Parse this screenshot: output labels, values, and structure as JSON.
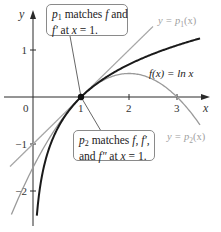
{
  "figure": {
    "type": "function-approximation-diagram",
    "axes": {
      "x_label": "x",
      "y_label": "y",
      "origin_label": "0",
      "x_ticks": [
        {
          "value": 1,
          "label": "1"
        },
        {
          "value": 2,
          "label": "2"
        },
        {
          "value": 3,
          "label": "3"
        }
      ],
      "y_ticks": [
        {
          "value": 1,
          "label": "1"
        },
        {
          "value": -1,
          "label": "−1"
        },
        {
          "value": -2,
          "label": "−2"
        }
      ],
      "x_range": [
        -0.7,
        3.6
      ],
      "y_range": [
        -2.7,
        1.8
      ]
    },
    "curves": [
      {
        "name": "f",
        "expression": "ln x",
        "label": "f(x) = ln x",
        "color": "#1a1a1a",
        "width": 2,
        "domain": [
          0.08,
          3.48
        ]
      },
      {
        "name": "p1",
        "expression": "x - 1",
        "label": "y = p1(x)",
        "color": "#a8a8a8",
        "width": 1.3,
        "domain": [
          -0.48,
          2.5
        ]
      },
      {
        "name": "p2",
        "expression": "(x-1) - (x-1)^2/2",
        "label": "y = p2(x)",
        "color": "#9a9a9a",
        "width": 1.3,
        "domain": [
          -0.45,
          3.48
        ]
      }
    ],
    "point": {
      "x": 1,
      "y": 0,
      "color": "#111111"
    },
    "labels": {
      "f_label": "f(x) = ln x",
      "p1_label_prefix": "y = p",
      "p1_label_sub": "1",
      "p1_label_suffix": "(x)",
      "p2_label_prefix": "y = p",
      "p2_label_sub": "2",
      "p2_label_suffix": "(x)"
    },
    "callouts": {
      "top": {
        "line1_p": "p",
        "line1_sub": "1",
        "line1_rest": " matches ",
        "line1_f": "f",
        "line1_end": " and",
        "line2_f": "f′",
        "line2_rest": " at ",
        "line2_x": "x",
        "line2_end": " = 1."
      },
      "bottom": {
        "line1_p": "p",
        "line1_sub": "2",
        "line1_rest": " matches ",
        "line1_f": "f, f′,",
        "line2_start": "and ",
        "line2_f": "f″",
        "line2_rest": " at ",
        "line2_x": "x",
        "line2_end": " = 1."
      }
    }
  }
}
